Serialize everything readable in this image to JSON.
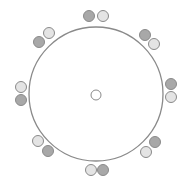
{
  "diagram": {
    "background": "#ffffff",
    "stroke_color": "#8a8a8a",
    "colors": {
      "dark": "#a8a8a8",
      "light": "#e4e4e4",
      "center": "#ffffff"
    },
    "main_circle": {
      "cx": 96,
      "cy": 94,
      "r": 67
    },
    "center_circle": {
      "cx": 96,
      "cy": 95,
      "r": 5
    },
    "node_radius": 5.5,
    "pairs": [
      {
        "position": "top",
        "nodes": [
          {
            "cx": 89,
            "cy": 16,
            "shade": "dark"
          },
          {
            "cx": 103,
            "cy": 16,
            "shade": "light"
          }
        ]
      },
      {
        "position": "top-right",
        "nodes": [
          {
            "cx": 145,
            "cy": 35,
            "shade": "dark"
          },
          {
            "cx": 154,
            "cy": 44,
            "shade": "light"
          }
        ]
      },
      {
        "position": "right",
        "nodes": [
          {
            "cx": 171,
            "cy": 84,
            "shade": "dark"
          },
          {
            "cx": 171,
            "cy": 97,
            "shade": "light"
          }
        ]
      },
      {
        "position": "bottom-right",
        "nodes": [
          {
            "cx": 155,
            "cy": 142,
            "shade": "dark"
          },
          {
            "cx": 146,
            "cy": 152,
            "shade": "light"
          }
        ]
      },
      {
        "position": "bottom",
        "nodes": [
          {
            "cx": 91,
            "cy": 170,
            "shade": "light"
          },
          {
            "cx": 103,
            "cy": 170,
            "shade": "dark"
          }
        ]
      },
      {
        "position": "bottom-left",
        "nodes": [
          {
            "cx": 38,
            "cy": 141,
            "shade": "light"
          },
          {
            "cx": 48,
            "cy": 151,
            "shade": "dark"
          }
        ]
      },
      {
        "position": "left",
        "nodes": [
          {
            "cx": 21,
            "cy": 87,
            "shade": "light"
          },
          {
            "cx": 21,
            "cy": 100,
            "shade": "dark"
          }
        ]
      },
      {
        "position": "top-left",
        "nodes": [
          {
            "cx": 49,
            "cy": 33,
            "shade": "light"
          },
          {
            "cx": 39,
            "cy": 42,
            "shade": "dark"
          }
        ]
      }
    ]
  }
}
